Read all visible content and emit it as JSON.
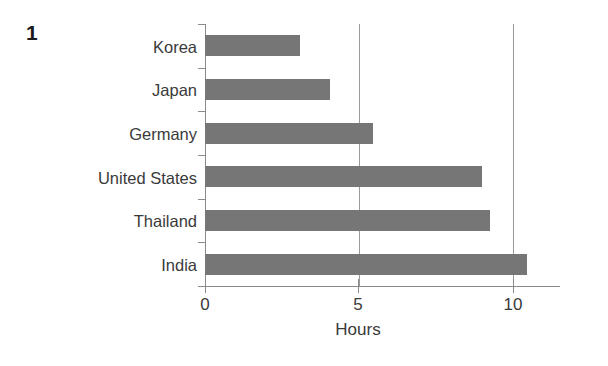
{
  "figure": {
    "number": "1"
  },
  "chart_data": {
    "type": "bar",
    "orientation": "horizontal",
    "title": "",
    "subtitle": "",
    "xlabel": "Hours",
    "ylabel": "",
    "categories": [
      "Korea",
      "Japan",
      "Germany",
      "United States",
      "Thailand",
      "India"
    ],
    "values": [
      3.1,
      4.05,
      5.45,
      9.0,
      9.25,
      10.45
    ],
    "series": [
      {
        "name": "Hours",
        "values": [
          3.1,
          4.05,
          5.45,
          9.0,
          9.25,
          10.45
        ]
      }
    ],
    "xlim": [
      0,
      11.5
    ],
    "xticks": [
      0,
      5,
      10
    ],
    "xticklabels": [
      "0",
      "5",
      "10"
    ],
    "grid": "vertical",
    "legend": "none",
    "bar_color": "#767676",
    "axis_color": "#8a8a8a",
    "gridline_color": "#9a9a9a",
    "text_color": "#3a3a3a",
    "background_color": "#ffffff"
  }
}
